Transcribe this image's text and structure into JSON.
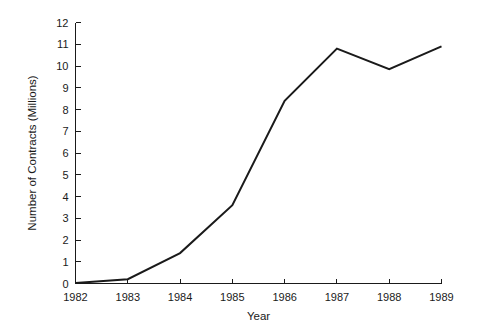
{
  "chart_data": {
    "type": "line",
    "title": "",
    "xlabel": "Year",
    "ylabel": "Number of Contracts (Millions)",
    "x": [
      1982,
      1983,
      1984,
      1985,
      1986,
      1987,
      1988,
      1989
    ],
    "categories": [
      "1982",
      "1983",
      "1984",
      "1985",
      "1986",
      "1987",
      "1988",
      "1989"
    ],
    "values": [
      0.02,
      0.2,
      1.4,
      3.6,
      8.4,
      10.8,
      9.85,
      10.9
    ],
    "series": [
      {
        "name": "Number of Contracts",
        "values": [
          0.02,
          0.2,
          1.4,
          3.6,
          8.4,
          10.8,
          9.85,
          10.9
        ]
      }
    ],
    "xlim": [
      1982,
      1989
    ],
    "ylim": [
      0,
      12
    ],
    "ytick_labels": [
      "0",
      "1",
      "2",
      "3",
      "4",
      "5",
      "6",
      "7",
      "8",
      "9",
      "10",
      "11",
      "12"
    ],
    "ytick_values": [
      0,
      1,
      2,
      3,
      4,
      5,
      6,
      7,
      8,
      9,
      10,
      11,
      12
    ],
    "xtick_labels": [
      "1982",
      "1983",
      "1984",
      "1985",
      "1986",
      "1987",
      "1988",
      "1989"
    ],
    "grid": false,
    "legend": false,
    "legend_position": "none",
    "line_color": "#1a1a1a",
    "background_color": "#ffffff",
    "tick_direction": "in",
    "spines": [
      "left",
      "bottom"
    ]
  }
}
